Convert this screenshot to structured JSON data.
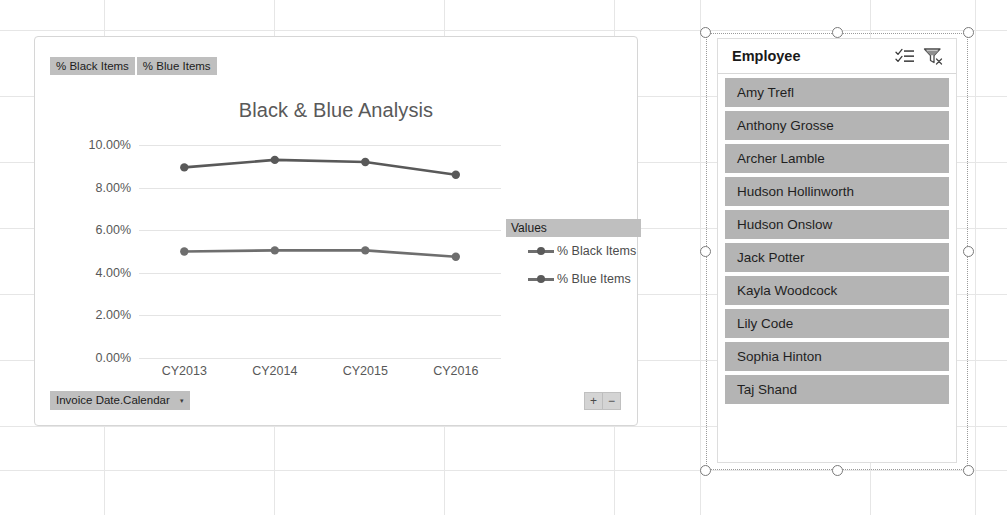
{
  "chart": {
    "title": "Black & Blue Analysis",
    "field_buttons": [
      {
        "label": "% Black Items"
      },
      {
        "label": "% Blue Items"
      }
    ],
    "date_field_button": {
      "label": "Invoice Date.Calendar",
      "caret": "▾"
    },
    "expand_collapse": {
      "expand": "+",
      "collapse": "−"
    },
    "legend": {
      "title": "Values",
      "entries": [
        {
          "label": "% Black Items",
          "color": "#595959"
        },
        {
          "label": "% Blue Items",
          "color": "#6e6e6e"
        }
      ]
    }
  },
  "chart_data": {
    "type": "line",
    "title": "Black & Blue Analysis",
    "xlabel": "",
    "ylabel": "",
    "categories": [
      "CY2013",
      "CY2014",
      "CY2015",
      "CY2016"
    ],
    "series": [
      {
        "name": "% Black Items",
        "values": [
          8.95,
          9.3,
          9.2,
          8.6
        ],
        "color": "#595959"
      },
      {
        "name": "% Blue Items",
        "values": [
          5.0,
          5.05,
          5.05,
          4.75
        ],
        "color": "#6e6e6e"
      }
    ],
    "ylim": [
      0,
      10
    ],
    "yticks": [
      0,
      2,
      4,
      6,
      8,
      10
    ],
    "ytick_labels": [
      "0.00%",
      "2.00%",
      "4.00%",
      "6.00%",
      "8.00%",
      "10.00%"
    ],
    "value_format": "percent",
    "grid": true,
    "legend_position": "right",
    "legend_title": "Values"
  },
  "slicer": {
    "title": "Employee",
    "multiselect_icon": "multi-select-icon",
    "clearfilter_icon": "clear-filter-icon",
    "items": [
      {
        "label": "Amy Trefl"
      },
      {
        "label": "Anthony Grosse"
      },
      {
        "label": "Archer Lamble"
      },
      {
        "label": "Hudson Hollinworth"
      },
      {
        "label": "Hudson Onslow"
      },
      {
        "label": "Jack Potter"
      },
      {
        "label": "Kayla Woodcock"
      },
      {
        "label": "Lily Code"
      },
      {
        "label": "Sophia Hinton"
      },
      {
        "label": "Taj Shand"
      }
    ]
  }
}
